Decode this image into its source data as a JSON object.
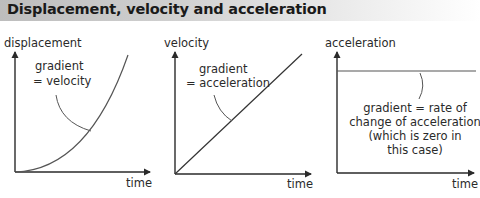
{
  "header": {
    "title": "Displacement, velocity and acceleration"
  },
  "panels": [
    {
      "id": "displacement",
      "y_label": "displacement",
      "x_label": "time",
      "annotation": [
        "gradient",
        "= velocity"
      ],
      "curve": "quadratic increasing"
    },
    {
      "id": "velocity",
      "y_label": "velocity",
      "x_label": "time",
      "annotation": [
        "gradient",
        "= acceleration"
      ],
      "curve": "linear increasing"
    },
    {
      "id": "acceleration",
      "y_label": "acceleration",
      "x_label": "time",
      "annotation": [
        "gradient = rate of",
        "change of acceleration",
        "(which is zero in",
        "this case)"
      ],
      "curve": "constant"
    }
  ],
  "colors": {
    "axis": "#2a2a2a",
    "curve": "#555555",
    "header_left": "#bdbdbd",
    "header_right": "#ffffff"
  }
}
